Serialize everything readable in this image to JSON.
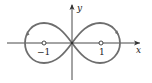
{
  "diagram": {
    "type": "parametric-curve-figure-eight",
    "axes": {
      "x_label": "x",
      "y_label": "y"
    },
    "ticks": [
      {
        "label": "−1",
        "value": -1
      },
      {
        "label": "1",
        "value": 1
      }
    ],
    "colors": {
      "curve": "#6e6e6e",
      "axes": "#333333",
      "background": "#ffffff"
    }
  }
}
